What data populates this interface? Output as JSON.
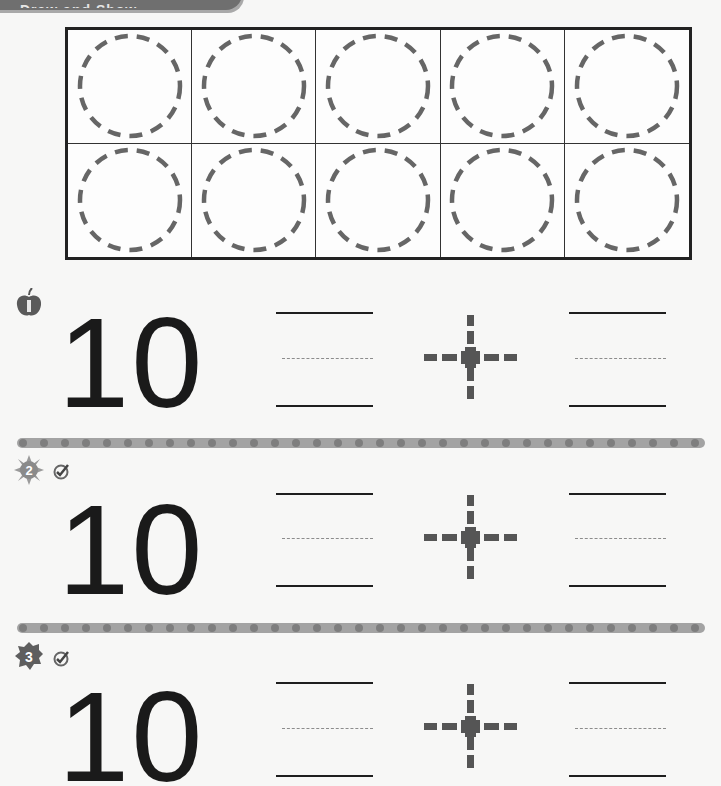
{
  "header": {
    "banner_label": "Draw and Show"
  },
  "ten_frame": {
    "rows": 2,
    "columns": 5,
    "cells": 10,
    "circle_style": "dashed"
  },
  "problems": [
    {
      "number": "1",
      "badge_icon": "apple-icon",
      "has_check": false,
      "total": "10",
      "operator": "+",
      "answer_left": "",
      "answer_right": ""
    },
    {
      "number": "2",
      "badge_icon": "sun-icon",
      "has_check": true,
      "total": "10",
      "operator": "+",
      "answer_left": "",
      "answer_right": ""
    },
    {
      "number": "3",
      "badge_icon": "leaf-icon",
      "has_check": true,
      "total": "10",
      "operator": "+",
      "answer_left": "",
      "answer_right": ""
    }
  ],
  "colors": {
    "ink": "#1a1a1a",
    "dash_gray": "#6b6b6b",
    "divider": "#a3a3a3",
    "divider_dot": "#7e7e7e",
    "paper": "#f7f7f6"
  }
}
